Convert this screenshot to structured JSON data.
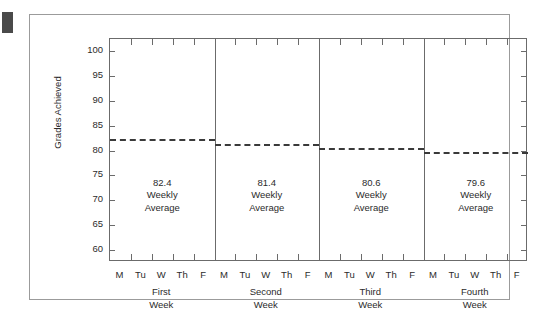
{
  "chart_data": {
    "type": "bar",
    "title": "",
    "subtitle": "",
    "xlabel": "",
    "ylabel": "Grades Achieved",
    "ylim": [
      57.5,
      102.5
    ],
    "yticks": [
      60,
      65,
      70,
      75,
      80,
      85,
      90,
      95,
      100
    ],
    "ytick_labels": [
      "60",
      "65",
      "70",
      "75",
      "80",
      "85",
      "90",
      "95",
      "100"
    ],
    "grid": false,
    "legend": false,
    "day_labels": [
      "M",
      "Tu",
      "W",
      "Th",
      "F"
    ],
    "categories": [
      "First Week",
      "Second Week",
      "Third Week",
      "Fourth Week"
    ],
    "series": [
      {
        "name": "Weekly Average",
        "values": [
          82.4,
          81.4,
          80.6,
          79.6
        ],
        "style": "dashed-horizontal-line"
      }
    ],
    "weeks": [
      {
        "caption_line1": "First",
        "caption_line2": "Week",
        "average_value": "82.4",
        "annotation_line2": "Weekly",
        "annotation_line3": "Average",
        "days": [
          "M",
          "Tu",
          "W",
          "Th",
          "F"
        ]
      },
      {
        "caption_line1": "Second",
        "caption_line2": "Week",
        "average_value": "81.4",
        "annotation_line2": "Weekly",
        "annotation_line3": "Average",
        "days": [
          "M",
          "Tu",
          "W",
          "Th",
          "F"
        ]
      },
      {
        "caption_line1": "Third",
        "caption_line2": "Week",
        "average_value": "80.6",
        "annotation_line2": "Weekly",
        "annotation_line3": "Average",
        "days": [
          "M",
          "Tu",
          "W",
          "Th",
          "F"
        ]
      },
      {
        "caption_line1": "Fourth",
        "caption_line2": "Week",
        "average_value": "79.6",
        "annotation_line2": "Weekly",
        "annotation_line3": "Average",
        "days": [
          "M",
          "Tu",
          "W",
          "Th",
          "F"
        ]
      }
    ],
    "colors": {
      "background": "#ffffff",
      "axis": "#6b6b6b",
      "frame": "#9b9b9b",
      "text": "#2b2b2b",
      "dash_line": "#3a3a3a",
      "corner_mark": "#4a4a4a"
    }
  }
}
